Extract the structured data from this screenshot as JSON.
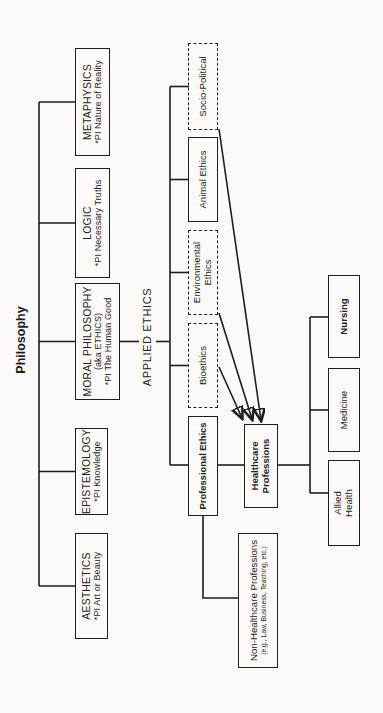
{
  "colors": {
    "ink": "#1e1e1e",
    "paper": "#fbfaf8"
  },
  "tree": {
    "root_label": "Philosophy",
    "branches": [
      {
        "title": "AESTHETICS",
        "subtitle": "*PI Art or Beauty"
      },
      {
        "title": "EPISTEMOLOGY",
        "subtitle": "*PI Knowledge"
      },
      {
        "title": "MORAL PHILOSOPHY",
        "aka": "(aka ETHICS)",
        "subtitle": "*PI The Human Good"
      },
      {
        "title": "LOGIC",
        "subtitle": "*PI Necessary Truths"
      },
      {
        "title": "METAPHYSICS",
        "subtitle": "*PI Nature of Reality"
      }
    ],
    "applied_ethics_label": "APPLIED ETHICS",
    "applied_branches": [
      {
        "label": "Professional Ethics",
        "border": "solid",
        "emphasis": "bold"
      },
      {
        "label": "Bioethics",
        "border": "dashed",
        "emphasis": "normal"
      },
      {
        "label": "Environmental Ethics",
        "border": "dashed",
        "emphasis": "normal"
      },
      {
        "label": "Animal Ethics",
        "border": "solid",
        "emphasis": "normal"
      },
      {
        "label": "Socio-Political",
        "border": "dashed",
        "emphasis": "normal"
      }
    ],
    "healthcare_professions": {
      "line1": "Healthcare",
      "line2": "Professions"
    },
    "non_healthcare_professions": {
      "line1": "Non-Healthcare Professions",
      "line2": "(e.g., Law, Business, Teaching, etc.)"
    },
    "healthcare_children": [
      {
        "line1": "Allied",
        "line2": "Health"
      },
      {
        "label": "Medicine"
      },
      {
        "label": "Nursing",
        "emphasis": "bold"
      }
    ]
  }
}
